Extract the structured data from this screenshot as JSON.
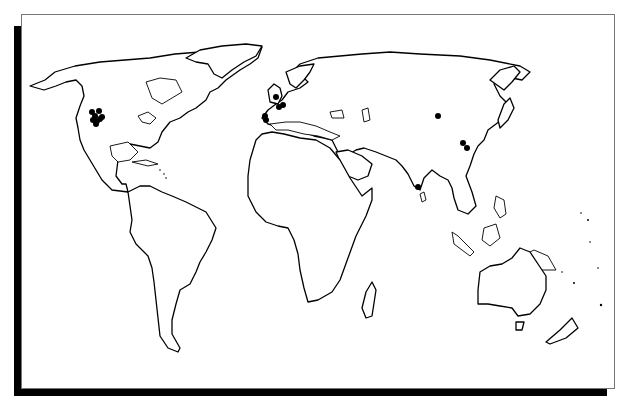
{
  "map": {
    "type": "world-outline",
    "projection": "equirectangular-style illustration",
    "frame": {
      "background": "#ffffff",
      "border": "#777777",
      "shadow": "#000000"
    },
    "marker_color": "#000000",
    "markers": [
      {
        "region": "North America (western interior)",
        "x": 92,
        "y": 112
      },
      {
        "region": "North America (western interior)",
        "x": 99,
        "y": 111
      },
      {
        "region": "North America (western interior)",
        "x": 95,
        "y": 116
      },
      {
        "region": "North America (western interior)",
        "x": 102,
        "y": 117
      },
      {
        "region": "North America (western interior)",
        "x": 97,
        "y": 121
      },
      {
        "region": "North America (western interior)",
        "x": 93,
        "y": 120
      },
      {
        "region": "North America (western interior)",
        "x": 100,
        "y": 119
      },
      {
        "region": "North America (western interior)",
        "x": 96,
        "y": 124
      },
      {
        "region": "Great Britain",
        "x": 276,
        "y": 97
      },
      {
        "region": "Low Countries",
        "x": 279,
        "y": 107
      },
      {
        "region": "Low Countries",
        "x": 283,
        "y": 105
      },
      {
        "region": "Iberia",
        "x": 265,
        "y": 116
      },
      {
        "region": "Iberia",
        "x": 266,
        "y": 120
      },
      {
        "region": "Central Asia",
        "x": 438,
        "y": 116
      },
      {
        "region": "China",
        "x": 463,
        "y": 143
      },
      {
        "region": "China",
        "x": 467,
        "y": 148
      },
      {
        "region": "Southern India / Sri Lanka",
        "x": 418,
        "y": 187
      }
    ]
  }
}
